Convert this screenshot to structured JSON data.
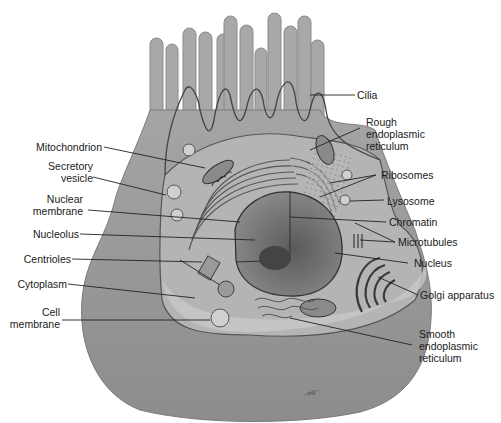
{
  "diagram": {
    "colors": {
      "cytoplasm": "#9a9a9a",
      "cell_body_dark": "#8e8e8e",
      "nucleus": "#6e6e6e",
      "nucleolus": "#4a4a4a",
      "membrane_line": "#444444",
      "leader_line": "#222222",
      "label_text": "#1a1a1a"
    },
    "labels_left": [
      {
        "id": "mitochondrion",
        "lines": [
          "Mitochondrion"
        ]
      },
      {
        "id": "secretory-vesicle",
        "lines": [
          "Secretory",
          "vesicle"
        ]
      },
      {
        "id": "nuclear-membrane",
        "lines": [
          "Nuclear",
          "membrane"
        ]
      },
      {
        "id": "nucleolus",
        "lines": [
          "Nucleolus"
        ]
      },
      {
        "id": "centrioles",
        "lines": [
          "Centrioles"
        ]
      },
      {
        "id": "cytoplasm",
        "lines": [
          "Cytoplasm"
        ]
      },
      {
        "id": "cell-membrane",
        "lines": [
          "Cell",
          "membrane"
        ]
      }
    ],
    "labels_right": [
      {
        "id": "cilia",
        "lines": [
          "Cilia"
        ]
      },
      {
        "id": "rough-er",
        "lines": [
          "Rough",
          "endoplasmic",
          "reticulum"
        ]
      },
      {
        "id": "ribosomes",
        "lines": [
          "Ribosomes"
        ]
      },
      {
        "id": "lysosome",
        "lines": [
          "Lysosome"
        ]
      },
      {
        "id": "chromatin",
        "lines": [
          "Chromatin"
        ]
      },
      {
        "id": "microtubules",
        "lines": [
          "Microtubules"
        ]
      },
      {
        "id": "nucleus",
        "lines": [
          "Nucleus"
        ]
      },
      {
        "id": "golgi",
        "lines": [
          "Golgi apparatus"
        ]
      },
      {
        "id": "smooth-er",
        "lines": [
          "Smooth",
          "endoplasmic",
          "reticulum"
        ]
      }
    ],
    "signature": "signature"
  }
}
